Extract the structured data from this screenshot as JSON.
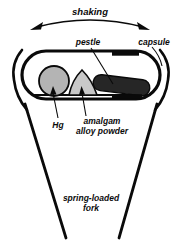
{
  "figure": {
    "background_color": "#ffffff",
    "stroke_color": "#0a0a0a",
    "width": 180,
    "height": 240
  },
  "labels": {
    "shaking": "shaking",
    "pestle": "pestle",
    "capsule": "capsule",
    "hg": "Hg",
    "amalgam_line1": "amalgam",
    "amalgam_line2": "alloy powder",
    "fork_line1": "spring-loaded",
    "fork_line2": "fork"
  },
  "parts": {
    "capsule_body": {
      "name": "capsule",
      "fill": "#ffffff",
      "stroke": "#0a0a0a",
      "stroke_width": 3.2
    },
    "capsule_cap": {
      "name": "capsule cap",
      "fill": "#0a0a0a"
    },
    "mercury": {
      "name": "Hg",
      "fill": "#b4b4b4",
      "stroke": "#0a0a0a",
      "shape": "circle"
    },
    "alloy_powder": {
      "name": "amalgam alloy powder",
      "fill": "#c8c8c8",
      "stroke": "#0a0a0a",
      "shape": "mound"
    },
    "pestle": {
      "name": "pestle",
      "fill": "#262626",
      "stroke": "#0a0a0a",
      "shape": "rounded-rod"
    },
    "fork": {
      "name": "spring-loaded fork",
      "stroke": "#0a0a0a",
      "stroke_width": 2.6
    },
    "shaking_arrow": {
      "name": "shaking motion arrow",
      "stroke": "#0a0a0a",
      "heads": "double",
      "curve": "arc"
    }
  }
}
